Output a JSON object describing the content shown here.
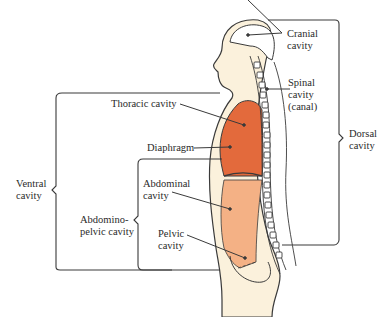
{
  "diagram": {
    "colors": {
      "thoracic": "#e36a3c",
      "abdominal": "#f4b185",
      "body_fill": "#fbf1dc",
      "outline": "#3a3a3a",
      "background": "#ffffff"
    },
    "labels": {
      "cranial": [
        "Cranial",
        "cavity"
      ],
      "spinal": [
        "Spinal",
        "cavity",
        "(canal)"
      ],
      "dorsal": [
        "Dorsal",
        "cavity"
      ],
      "thoracic": "Thoracic cavity",
      "diaphragm": "Diaphragm",
      "ventral": [
        "Ventral",
        "cavity"
      ],
      "abdominal": [
        "Abdominal",
        "cavity"
      ],
      "abdominopelvic": [
        "Abdomino-",
        "pelvic cavity"
      ],
      "pelvic": [
        "Pelvic",
        "cavity"
      ]
    }
  }
}
